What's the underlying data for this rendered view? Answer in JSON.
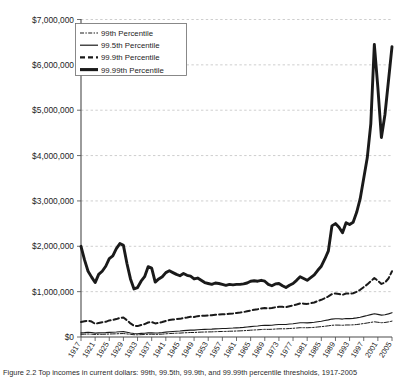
{
  "figure": {
    "caption": "Figure 2.2  Top incomes in current dollars: 99th, 99.5th, 99.9th, and 99.99th percentile thresholds, 1917-2005"
  },
  "chart_data": {
    "type": "line",
    "title": "",
    "xlabel": "",
    "ylabel": "",
    "xlim": [
      1917,
      2005
    ],
    "ylim": [
      0,
      7000000
    ],
    "grid": true,
    "legend_position": "top-left",
    "ytick_labels": [
      "$7,000,000",
      "$6,000,000",
      "$5,000,000",
      "$4,000,000",
      "$3,000,000",
      "$2,000,000",
      "$1,000,000",
      "$0"
    ],
    "ytick_values": [
      7000000,
      6000000,
      5000000,
      4000000,
      3000000,
      2000000,
      1000000,
      0
    ],
    "xtick_labels": [
      "1917",
      "1921",
      "1925",
      "1929",
      "1933",
      "1937",
      "1941",
      "1945",
      "1949",
      "1953",
      "1957",
      "1961",
      "1965",
      "1969",
      "1973",
      "1977",
      "1981",
      "1985",
      "1989",
      "1993",
      "1997",
      "2001",
      "2005"
    ],
    "x": [
      1917,
      1918,
      1919,
      1920,
      1921,
      1922,
      1923,
      1924,
      1925,
      1926,
      1927,
      1928,
      1929,
      1930,
      1931,
      1932,
      1933,
      1934,
      1935,
      1936,
      1937,
      1938,
      1939,
      1940,
      1941,
      1942,
      1943,
      1944,
      1945,
      1946,
      1947,
      1948,
      1949,
      1950,
      1951,
      1952,
      1953,
      1954,
      1955,
      1956,
      1957,
      1958,
      1959,
      1960,
      1961,
      1962,
      1963,
      1964,
      1965,
      1966,
      1967,
      1968,
      1969,
      1970,
      1971,
      1972,
      1973,
      1974,
      1975,
      1976,
      1977,
      1978,
      1979,
      1980,
      1981,
      1982,
      1983,
      1984,
      1985,
      1986,
      1987,
      1988,
      1989,
      1990,
      1991,
      1992,
      1993,
      1994,
      1995,
      1996,
      1997,
      1998,
      1999,
      2000,
      2001,
      2002,
      2003,
      2004,
      2005
    ],
    "series": [
      {
        "name": "99th Percentile",
        "line_style": "dash-dot",
        "line_width": 1.0,
        "color": "#1a1a1a",
        "values": [
          60000,
          62000,
          66000,
          63000,
          55000,
          58000,
          60000,
          62000,
          66000,
          68000,
          70000,
          74000,
          76000,
          68000,
          58000,
          50000,
          48000,
          52000,
          55000,
          60000,
          62000,
          58000,
          60000,
          64000,
          70000,
          76000,
          80000,
          84000,
          86000,
          92000,
          95000,
          99000,
          99000,
          104000,
          108000,
          110000,
          112000,
          113000,
          117000,
          120000,
          122000,
          123000,
          127000,
          129000,
          132000,
          135000,
          139000,
          144000,
          150000,
          155000,
          159000,
          165000,
          169000,
          168000,
          170000,
          176000,
          180000,
          181000,
          181000,
          187000,
          192000,
          198000,
          205000,
          205000,
          204000,
          208000,
          212000,
          221000,
          228000,
          237000,
          247000,
          258000,
          263000,
          262000,
          258000,
          265000,
          265000,
          268000,
          275000,
          285000,
          297000,
          309000,
          322000,
          335000,
          325000,
          315000,
          320000,
          333000,
          350000
        ]
      },
      {
        "name": "99.5th Percentile",
        "line_style": "solid",
        "line_width": 1.1,
        "color": "#1a1a1a",
        "values": [
          92000,
          96000,
          102000,
          98000,
          85000,
          90000,
          93000,
          96000,
          102000,
          105000,
          109000,
          115000,
          118000,
          105000,
          89000,
          76000,
          73000,
          79000,
          84000,
          92000,
          95000,
          89000,
          92000,
          98000,
          107000,
          116000,
          122000,
          128000,
          131000,
          140000,
          145000,
          151000,
          151000,
          159000,
          165000,
          168000,
          171000,
          173000,
          179000,
          183000,
          186000,
          188000,
          194000,
          197000,
          202000,
          206000,
          212000,
          220000,
          229000,
          237000,
          243000,
          252000,
          258000,
          257000,
          260000,
          269000,
          275000,
          277000,
          277000,
          286000,
          293000,
          303000,
          313000,
          313000,
          312000,
          318000,
          324000,
          338000,
          349000,
          363000,
          378000,
          395000,
          403000,
          401000,
          395000,
          406000,
          406000,
          410000,
          421000,
          436000,
          455000,
          473000,
          493000,
          513000,
          498000,
          482000,
          490000,
          510000,
          536000
        ]
      },
      {
        "name": "99.9th Percentile",
        "line_style": "long-dash",
        "line_width": 2.0,
        "color": "#1a1a1a",
        "values": [
          330000,
          345000,
          360000,
          340000,
          290000,
          310000,
          325000,
          335000,
          365000,
          375000,
          395000,
          420000,
          430000,
          370000,
          300000,
          250000,
          240000,
          265000,
          285000,
          320000,
          330000,
          300000,
          310000,
          330000,
          355000,
          375000,
          385000,
          395000,
          400000,
          420000,
          430000,
          445000,
          440000,
          460000,
          470000,
          470000,
          475000,
          478000,
          490000,
          497000,
          500000,
          503000,
          515000,
          520000,
          530000,
          538000,
          550000,
          567000,
          585000,
          600000,
          612000,
          630000,
          640000,
          632000,
          638000,
          655000,
          665000,
          665000,
          660000,
          680000,
          695000,
          715000,
          740000,
          735000,
          730000,
          745000,
          760000,
          795000,
          820000,
          855000,
          895000,
          945000,
          960000,
          950000,
          930000,
          960000,
          955000,
          965000,
          995000,
          1040000,
          1100000,
          1160000,
          1230000,
          1300000,
          1240000,
          1170000,
          1200000,
          1290000,
          1450000
        ]
      },
      {
        "name": "99.99th Percentile",
        "line_style": "solid",
        "line_width": 2.9,
        "color": "#1a1a1a",
        "values": [
          2000000,
          1700000,
          1450000,
          1320000,
          1200000,
          1380000,
          1450000,
          1560000,
          1730000,
          1790000,
          1950000,
          2060000,
          2020000,
          1620000,
          1280000,
          1060000,
          1090000,
          1230000,
          1330000,
          1550000,
          1520000,
          1210000,
          1280000,
          1330000,
          1420000,
          1460000,
          1420000,
          1380000,
          1350000,
          1400000,
          1360000,
          1340000,
          1280000,
          1300000,
          1250000,
          1200000,
          1180000,
          1160000,
          1190000,
          1180000,
          1160000,
          1140000,
          1160000,
          1150000,
          1160000,
          1160000,
          1170000,
          1190000,
          1230000,
          1240000,
          1230000,
          1250000,
          1230000,
          1160000,
          1130000,
          1170000,
          1180000,
          1130000,
          1090000,
          1140000,
          1180000,
          1250000,
          1330000,
          1290000,
          1250000,
          1310000,
          1370000,
          1470000,
          1560000,
          1720000,
          1900000,
          2450000,
          2500000,
          2420000,
          2300000,
          2520000,
          2480000,
          2530000,
          2750000,
          3050000,
          3500000,
          3950000,
          4700000,
          6450000,
          5500000,
          4400000,
          4900000,
          5650000,
          6400000
        ]
      }
    ]
  },
  "legend": {
    "entries": [
      {
        "label": "99th Percentile",
        "style": "dash-dot"
      },
      {
        "label": "99.5th Percentile",
        "style": "solid-thin"
      },
      {
        "label": "99.9th Percentile",
        "style": "long-dash"
      },
      {
        "label": "99.99th Percentile",
        "style": "solid-thick"
      }
    ]
  }
}
